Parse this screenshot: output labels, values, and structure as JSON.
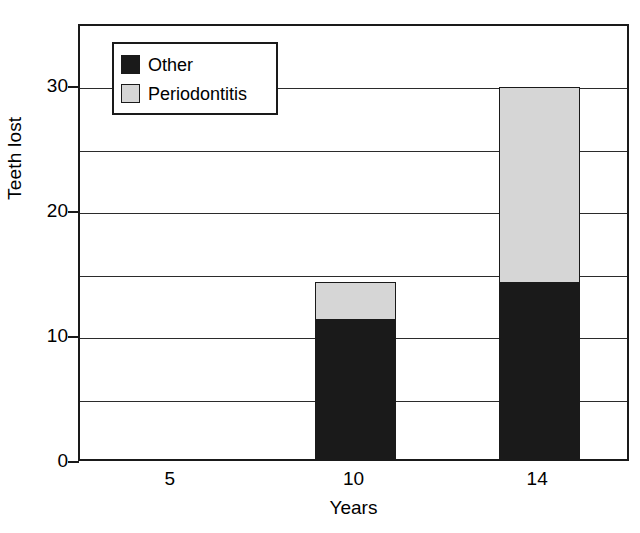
{
  "chart_data": {
    "type": "bar",
    "subtype": "stacked-bar",
    "title": "",
    "xlabel": "Years",
    "ylabel": "Teeth lost",
    "categories": [
      "5",
      "10",
      "14"
    ],
    "series": [
      {
        "name": "Other",
        "color": "#1a1a1a",
        "values": [
          0,
          11.3,
          14.3
        ]
      },
      {
        "name": "Periodontitis",
        "color": "#d6d6d6",
        "values": [
          0,
          3.1,
          15.7
        ]
      }
    ],
    "totals": [
      0,
      14.4,
      30.0
    ],
    "ylim": [
      0,
      35
    ],
    "y_tick_labels": [
      "0",
      "10",
      "20",
      "30"
    ],
    "y_tick_values": [
      0,
      10,
      20,
      30
    ],
    "gridline_values": [
      5,
      10,
      15,
      20,
      25,
      30,
      35
    ],
    "grid": true,
    "legend_position": "top-left-inside",
    "legend_entries": [
      {
        "label": "Other",
        "swatch": "legend-swatch-other",
        "color": "#1a1a1a"
      },
      {
        "label": "Periodontitis",
        "swatch": "legend-swatch-periodontitis",
        "color": "#d6d6d6"
      }
    ],
    "background_color": "#ffffff",
    "axis_color": "#1a1a1a"
  }
}
